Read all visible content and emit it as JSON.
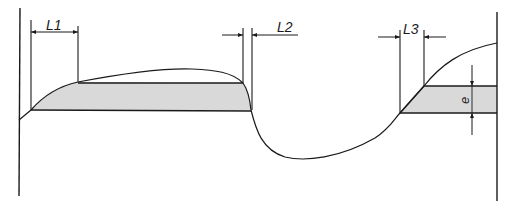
{
  "diagram": {
    "labels": {
      "l1": "L1",
      "l2": "L2",
      "l3": "L3",
      "e": "e"
    },
    "colors": {
      "line": "#1a1a1a",
      "fill": "#d9d9d9",
      "background": "#ffffff"
    }
  }
}
